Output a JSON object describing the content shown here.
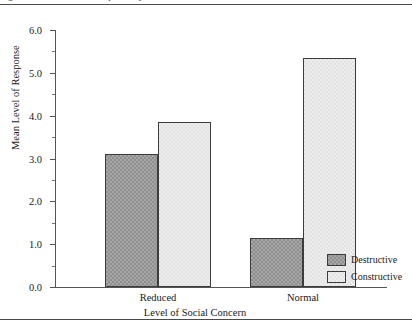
{
  "figure": {
    "caption_sliver": "Figure 1. Mean level of response by level of social concern."
  },
  "legend": {
    "position": "bottom-right",
    "items": [
      {
        "label": "Destructive",
        "swatch": "#8e8e8e",
        "name": "legend-swatch-destructive"
      },
      {
        "label": "Constructive",
        "swatch": "#eeeeee",
        "name": "legend-swatch-constructive"
      }
    ]
  },
  "chart_data": {
    "type": "bar",
    "title": "",
    "subtitle": "",
    "xlabel": "Level of Social Concern",
    "ylabel": "Mean Level of Response",
    "categories": [
      "Reduced",
      "Normal"
    ],
    "series": [
      {
        "name": "Destructive",
        "color": "#8e8e8e",
        "values": [
          3.1,
          1.15
        ]
      },
      {
        "name": "Constructive",
        "color": "#eeeeee",
        "values": [
          3.85,
          5.35
        ]
      }
    ],
    "ylim": [
      0.0,
      6.0
    ],
    "ytick_labels": [
      "0.0",
      "1.0",
      "2.0",
      "3.0",
      "4.0",
      "5.0",
      "6.0"
    ],
    "ytick_values": [
      0.0,
      1.0,
      2.0,
      3.0,
      4.0,
      5.0,
      6.0
    ],
    "yminor_step": 0.5,
    "grid": false,
    "legend_position": "bottom-right"
  }
}
